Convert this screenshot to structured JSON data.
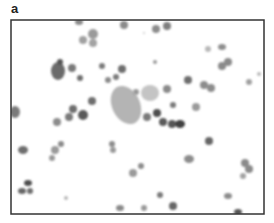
{
  "figure": {
    "panel_label": "a",
    "frame": {
      "x": 11,
      "y": 20,
      "width": 253,
      "height": 194,
      "stroke": "#333333"
    },
    "cells": [
      {
        "cx": 79,
        "cy": 22,
        "rx": 4,
        "ry": 3,
        "fill": "#8a8a8a"
      },
      {
        "cx": 124,
        "cy": 25,
        "rx": 4,
        "ry": 4,
        "fill": "#8a8a8a"
      },
      {
        "cx": 156,
        "cy": 29,
        "rx": 4,
        "ry": 4,
        "fill": "#8c8c8c"
      },
      {
        "cx": 167,
        "cy": 26,
        "rx": 4,
        "ry": 4,
        "fill": "#7e7e7e"
      },
      {
        "cx": 93,
        "cy": 34,
        "rx": 5,
        "ry": 5,
        "fill": "#9a9a9a"
      },
      {
        "cx": 83,
        "cy": 40,
        "rx": 4,
        "ry": 4,
        "fill": "#a0a0a0"
      },
      {
        "cx": 93,
        "cy": 43,
        "rx": 4,
        "ry": 4,
        "fill": "#a3a3a3"
      },
      {
        "cx": 144,
        "cy": 33,
        "rx": 1,
        "ry": 1,
        "fill": "#c8c8c8"
      },
      {
        "cx": 208,
        "cy": 49,
        "rx": 3,
        "ry": 3,
        "fill": "#b8b8b8"
      },
      {
        "cx": 222,
        "cy": 47,
        "rx": 4,
        "ry": 3,
        "fill": "#8e8e8e"
      },
      {
        "cx": 58,
        "cy": 71,
        "rx": 7,
        "ry": 9,
        "fill": "#6a6a6a"
      },
      {
        "cx": 60,
        "cy": 62,
        "rx": 3,
        "ry": 3,
        "fill": "#555555"
      },
      {
        "cx": 72,
        "cy": 68,
        "rx": 4,
        "ry": 4,
        "fill": "#7a7a7a"
      },
      {
        "cx": 80,
        "cy": 78,
        "rx": 3,
        "ry": 3,
        "fill": "#6e6e6e"
      },
      {
        "cx": 102,
        "cy": 66,
        "rx": 3,
        "ry": 3,
        "fill": "#7a7a7a"
      },
      {
        "cx": 122,
        "cy": 69,
        "rx": 4,
        "ry": 4,
        "fill": "#6e6e6e"
      },
      {
        "cx": 155,
        "cy": 62,
        "rx": 2,
        "ry": 2,
        "fill": "#9a9a9a"
      },
      {
        "cx": 222,
        "cy": 66,
        "rx": 4,
        "ry": 4,
        "fill": "#8a8a8a"
      },
      {
        "cx": 228,
        "cy": 62,
        "rx": 4,
        "ry": 4,
        "fill": "#8a8a8a"
      },
      {
        "cx": 116,
        "cy": 77,
        "rx": 3,
        "ry": 3,
        "fill": "#7a7a7a"
      },
      {
        "cx": 108,
        "cy": 80,
        "rx": 3,
        "ry": 3,
        "fill": "#8a8a8a"
      },
      {
        "cx": 188,
        "cy": 80,
        "rx": 4,
        "ry": 4,
        "fill": "#6e6e6e"
      },
      {
        "cx": 249,
        "cy": 82,
        "rx": 3,
        "ry": 3,
        "fill": "#a0a0a0"
      },
      {
        "cx": 259,
        "cy": 74,
        "rx": 2,
        "ry": 2,
        "fill": "#b8b8b8"
      },
      {
        "cx": 204,
        "cy": 85,
        "rx": 4,
        "ry": 4,
        "fill": "#8c8c8c"
      },
      {
        "cx": 211,
        "cy": 88,
        "rx": 4,
        "ry": 4,
        "fill": "#8c8c8c"
      },
      {
        "cx": 136,
        "cy": 92,
        "rx": 3,
        "ry": 3,
        "fill": "#9a9a9a"
      },
      {
        "cx": 167,
        "cy": 89,
        "rx": 4,
        "ry": 4,
        "fill": "#8a8a8a"
      },
      {
        "cx": 92,
        "cy": 101,
        "rx": 4,
        "ry": 4,
        "fill": "#6e6e6e"
      },
      {
        "cx": 173,
        "cy": 105,
        "rx": 3,
        "ry": 3,
        "fill": "#7a7a7a"
      },
      {
        "cx": 196,
        "cy": 107,
        "rx": 4,
        "ry": 4,
        "fill": "#9a9a9a"
      },
      {
        "cx": 15,
        "cy": 112,
        "rx": 5,
        "ry": 6,
        "fill": "#7a7a7a"
      },
      {
        "cx": 73,
        "cy": 109,
        "rx": 4,
        "ry": 4,
        "fill": "#6e6e6e"
      },
      {
        "cx": 69,
        "cy": 117,
        "rx": 4,
        "ry": 4,
        "fill": "#7a7a7a"
      },
      {
        "cx": 83,
        "cy": 115,
        "rx": 5,
        "ry": 5,
        "fill": "#5a5a5a"
      },
      {
        "cx": 57,
        "cy": 122,
        "rx": 4,
        "ry": 4,
        "fill": "#8c8c8c"
      },
      {
        "cx": 157,
        "cy": 113,
        "rx": 4,
        "ry": 4,
        "fill": "#4e4e4e"
      },
      {
        "cx": 147,
        "cy": 117,
        "rx": 4,
        "ry": 4,
        "fill": "#7a7a7a"
      },
      {
        "cx": 163,
        "cy": 122,
        "rx": 4,
        "ry": 4,
        "fill": "#5a5a5a"
      },
      {
        "cx": 172,
        "cy": 124,
        "rx": 4,
        "ry": 4,
        "fill": "#555555"
      },
      {
        "cx": 180,
        "cy": 124,
        "rx": 5,
        "ry": 4,
        "fill": "#404040"
      },
      {
        "cx": 209,
        "cy": 141,
        "rx": 4,
        "ry": 4,
        "fill": "#666666"
      },
      {
        "cx": 23,
        "cy": 150,
        "rx": 5,
        "ry": 4,
        "fill": "#6e6e6e"
      },
      {
        "cx": 61,
        "cy": 144,
        "rx": 3,
        "ry": 3,
        "fill": "#8a8a8a"
      },
      {
        "cx": 55,
        "cy": 150,
        "rx": 4,
        "ry": 4,
        "fill": "#9a9a9a"
      },
      {
        "cx": 52,
        "cy": 158,
        "rx": 3,
        "ry": 3,
        "fill": "#9a9a9a"
      },
      {
        "cx": 112,
        "cy": 144,
        "rx": 3,
        "ry": 3,
        "fill": "#8c8c8c"
      },
      {
        "cx": 113,
        "cy": 150,
        "rx": 3,
        "ry": 3,
        "fill": "#9a9a9a"
      },
      {
        "cx": 189,
        "cy": 159,
        "rx": 5,
        "ry": 4,
        "fill": "#8c8c8c"
      },
      {
        "cx": 245,
        "cy": 163,
        "rx": 4,
        "ry": 4,
        "fill": "#8a8a8a"
      },
      {
        "cx": 249,
        "cy": 169,
        "rx": 4,
        "ry": 4,
        "fill": "#8a8a8a"
      },
      {
        "cx": 243,
        "cy": 176,
        "rx": 3,
        "ry": 3,
        "fill": "#a3a3a3"
      },
      {
        "cx": 141,
        "cy": 166,
        "rx": 3,
        "ry": 3,
        "fill": "#8c8c8c"
      },
      {
        "cx": 133,
        "cy": 173,
        "rx": 4,
        "ry": 4,
        "fill": "#9a9a9a"
      },
      {
        "cx": 28,
        "cy": 183,
        "rx": 4,
        "ry": 3,
        "fill": "#4e4e4e"
      },
      {
        "cx": 22,
        "cy": 191,
        "rx": 4,
        "ry": 3,
        "fill": "#666666"
      },
      {
        "cx": 30,
        "cy": 191,
        "rx": 3,
        "ry": 3,
        "fill": "#6e6e6e"
      },
      {
        "cx": 66,
        "cy": 198,
        "rx": 2,
        "ry": 2,
        "fill": "#b8b8b8"
      },
      {
        "cx": 160,
        "cy": 195,
        "rx": 3,
        "ry": 3,
        "fill": "#7a7a7a"
      },
      {
        "cx": 228,
        "cy": 196,
        "rx": 4,
        "ry": 3,
        "fill": "#8c8c8c"
      },
      {
        "cx": 120,
        "cy": 208,
        "rx": 4,
        "ry": 3,
        "fill": "#8a8a8a"
      },
      {
        "cx": 144,
        "cy": 208,
        "rx": 3,
        "ry": 3,
        "fill": "#9a9a9a"
      },
      {
        "cx": 173,
        "cy": 206,
        "rx": 4,
        "ry": 4,
        "fill": "#666666"
      },
      {
        "cx": 238,
        "cy": 212,
        "rx": 4,
        "ry": 3,
        "fill": "#555555"
      }
    ],
    "pale_clusters": [
      {
        "cx": 126,
        "cy": 105,
        "rx": 14,
        "ry": 20,
        "rotate": -25,
        "fill": "#b4b4b4"
      },
      {
        "cx": 150,
        "cy": 93,
        "rx": 9,
        "ry": 8,
        "rotate": 0,
        "fill": "#c4c4c4"
      }
    ]
  }
}
